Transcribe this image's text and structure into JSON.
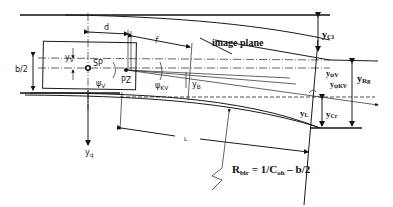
{
  "diagram": {
    "title_label": "image plane",
    "formula": {
      "R": "R",
      "R_sub": "blr",
      "mid": " = 1/C",
      "C_sub": "oh",
      "tail": " – b/2"
    },
    "labels": {
      "d": "d",
      "f": "f",
      "b_half": "b/2",
      "yv": "y",
      "yv_sub": "V",
      "sp": "SP",
      "pz": "PZ",
      "psi_v": "ψ",
      "psi_v_sub": "V",
      "psi_kv": "ψ",
      "psi_kv_sub": "KV",
      "yb": "y",
      "yb_sub": "B",
      "yq": "y",
      "yq_sub": "q",
      "L": "L",
      "ycl": "y",
      "ycl_sub": "Cl",
      "yrg": "y",
      "yrg_sub": "Rg",
      "ypsiv": "y",
      "ypsiv_sub": "ψV",
      "ypsikv": "y",
      "ypsikv_sub": "ψKV",
      "yl": "y",
      "yl_sub": "L",
      "ycr": "y",
      "ycr_sub": "Cr"
    }
  }
}
